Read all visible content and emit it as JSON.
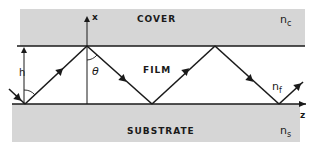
{
  "diagram": {
    "type": "slab-waveguide-ray-diagram",
    "regions": [
      {
        "id": "cover",
        "label": "COVER",
        "index_symbol": "n",
        "index_subscript": "c"
      },
      {
        "id": "film",
        "label": "FILM",
        "index_symbol": "n",
        "index_subscript": "f"
      },
      {
        "id": "substrate",
        "label": "SUBSTRATE",
        "index_symbol": "n",
        "index_subscript": "s"
      }
    ],
    "axes": {
      "vertical": "x",
      "horizontal": "z"
    },
    "annotations": {
      "thickness": "h",
      "angle": "θ"
    },
    "colors": {
      "region_fill": "#d6d6d6",
      "line": "#1a1a1a",
      "background": "#ffffff"
    }
  }
}
